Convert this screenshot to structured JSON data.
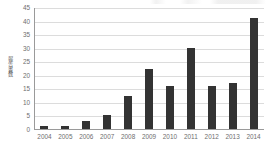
{
  "chart_data": {
    "type": "bar",
    "title": "",
    "subtitle": "",
    "xlabel": "",
    "ylabel": "報告書数",
    "categories": [
      "2004",
      "2005",
      "2006",
      "2007",
      "2008",
      "2009",
      "2010",
      "2011",
      "2012",
      "2013",
      "2014"
    ],
    "values": [
      1,
      1,
      3,
      5,
      12,
      22,
      16,
      30,
      16,
      17,
      41
    ],
    "series": [
      {
        "name": "報告書数",
        "values": [
          1,
          1,
          3,
          5,
          12,
          22,
          16,
          30,
          16,
          17,
          41
        ]
      }
    ],
    "ylim": [
      0,
      45
    ],
    "ytick_step": 5,
    "ytick_labels": [
      "45",
      "40",
      "35",
      "30",
      "25",
      "20",
      "15",
      "10",
      "5",
      "0"
    ],
    "ytick_values": [
      45,
      40,
      35,
      30,
      25,
      20,
      15,
      10,
      5,
      0
    ],
    "grid": true,
    "grid_axis": "y",
    "legend": false,
    "legend_position": "none",
    "bar_color": "#333333",
    "gridline_color": "#dcdcdc",
    "axis_color": "#9a9a9a",
    "tick_text_color": "#6e6e6e",
    "background_color": "#ffffff",
    "annotations": []
  }
}
